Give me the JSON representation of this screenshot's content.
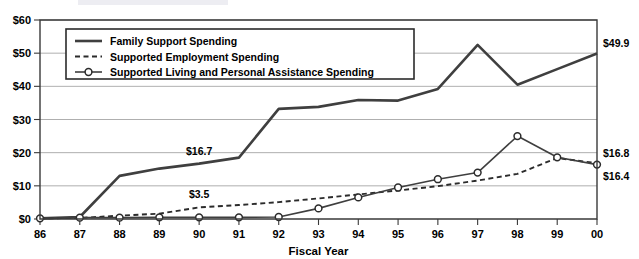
{
  "chart_data": {
    "type": "line",
    "title": "",
    "xlabel": "Fiscal Year",
    "ylabel": "",
    "categories": [
      "86",
      "87",
      "88",
      "89",
      "90",
      "91",
      "92",
      "93",
      "94",
      "95",
      "96",
      "97",
      "98",
      "99",
      "00"
    ],
    "ylim": [
      0,
      60
    ],
    "ytick_labels": [
      "$0",
      "$10",
      "$20",
      "$30",
      "$40",
      "$50",
      "$60"
    ],
    "ytick_values": [
      0,
      10,
      20,
      30,
      40,
      50,
      60
    ],
    "grid": "horizontal",
    "legend_position": "top-left",
    "series": [
      {
        "name": "Family Support Spending",
        "style": "solid",
        "marker": "none",
        "values": [
          0.2,
          0.6,
          13.0,
          15.2,
          16.7,
          18.5,
          33.2,
          33.8,
          35.9,
          35.7,
          39.2,
          52.5,
          40.5,
          45.2,
          49.9
        ]
      },
      {
        "name": "Supported Employment Spending",
        "style": "dashed",
        "marker": "none",
        "values": [
          0.2,
          0.3,
          1.0,
          1.6,
          3.5,
          4.2,
          5.1,
          6.2,
          7.4,
          8.6,
          9.9,
          11.6,
          13.6,
          18.4,
          16.8
        ]
      },
      {
        "name": "Supported Living and Personal Assistance Spending",
        "style": "solid-marker",
        "marker": "circle",
        "values": [
          0.2,
          0.4,
          0.4,
          0.5,
          0.5,
          0.5,
          0.6,
          3.2,
          6.5,
          9.5,
          12.0,
          14.0,
          25.0,
          18.6,
          16.4
        ]
      }
    ],
    "annotations": [
      {
        "text": "$16.7",
        "series": "Family Support Spending",
        "category": "90",
        "value": 16.7
      },
      {
        "text": "$3.5",
        "series": "Supported Employment Spending",
        "category": "90",
        "value": 3.5
      },
      {
        "text": "$49.9",
        "series": "Family Support Spending",
        "category": "00",
        "value": 49.9
      },
      {
        "text": "$16.8",
        "series": "Supported Employment Spending",
        "category": "00",
        "value": 16.8
      },
      {
        "text": "$16.4",
        "series": "Supported Living and Personal Assistance Spending",
        "category": "00",
        "value": 16.4
      }
    ]
  }
}
